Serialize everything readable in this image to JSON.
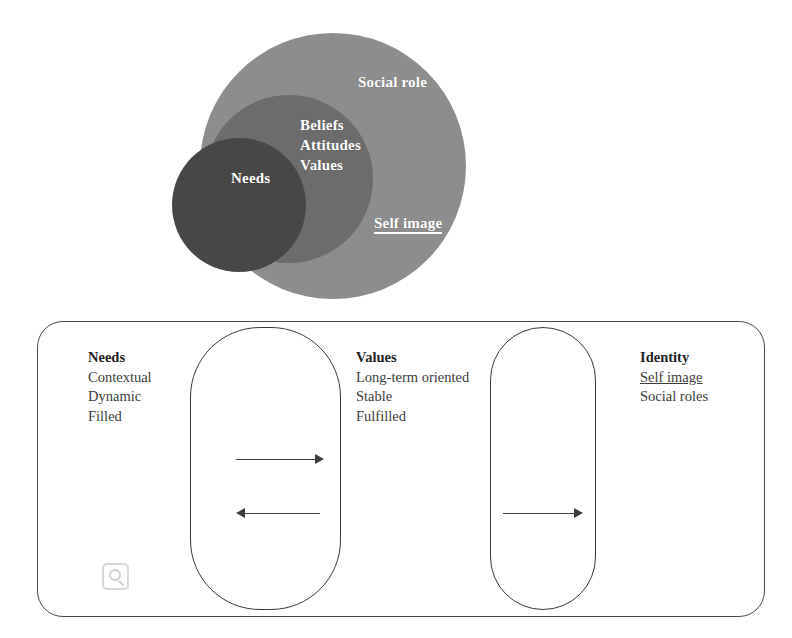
{
  "venn": {
    "circles": [
      {
        "id": "outer",
        "label": "Social role",
        "color": "#8d8d8d"
      },
      {
        "id": "middle",
        "label": "Beliefs Attitudes Values",
        "color": "#6c6c6c"
      },
      {
        "id": "inner",
        "label": "Needs",
        "color": "#474747"
      }
    ],
    "labels": {
      "social_role": "Social role",
      "beliefs": "Beliefs",
      "attitudes": "Attitudes",
      "values": "Values",
      "needs": "Needs",
      "self_image": "Self image"
    }
  },
  "panel": {
    "columns": [
      {
        "heading": "Needs",
        "items": [
          "Contextual",
          "Dynamic",
          "Filled"
        ]
      },
      {
        "heading": "Values",
        "items": [
          "Long-term oriented",
          "Stable",
          "Fulfilled"
        ]
      },
      {
        "heading": "Identity",
        "items": [
          "Self image",
          "Social roles"
        ],
        "underlined_items": [
          "Self image"
        ]
      }
    ],
    "arrows": [
      {
        "id": "needs-to-values",
        "direction": "right"
      },
      {
        "id": "values-to-needs",
        "direction": "left"
      },
      {
        "id": "values-to-identity",
        "direction": "right"
      }
    ]
  },
  "watermark": {
    "icon": "magnifier-icon"
  },
  "colors": {
    "outer_circle": "#8d8d8d",
    "middle_circle": "#6c6c6c",
    "inner_circle": "#474747",
    "stroke": "#3a3a3a",
    "text": "#3d3d3d",
    "label_text": "#ffffff"
  }
}
